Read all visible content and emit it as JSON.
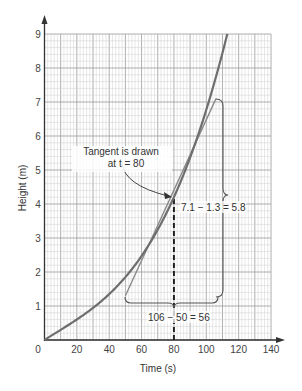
{
  "chart_data": {
    "type": "line",
    "title": "",
    "xlabel": "Time (s)",
    "ylabel": "Height (m)",
    "xlim": [
      0,
      140
    ],
    "ylim": [
      0,
      9
    ],
    "grid": true,
    "x_ticks": [
      "0",
      "20",
      "40",
      "60",
      "80",
      "100",
      "120",
      "140"
    ],
    "y_ticks": [
      "1",
      "2",
      "3",
      "4",
      "5",
      "6",
      "7",
      "8",
      "9"
    ],
    "series": [
      {
        "name": "height curve",
        "x": [
          0,
          20,
          40,
          60,
          80,
          100,
          113
        ],
        "values": [
          0,
          0.6,
          1.35,
          2.5,
          4.2,
          6.8,
          9.0
        ]
      },
      {
        "name": "tangent at t = 80",
        "x": [
          50,
          106
        ],
        "values": [
          1.3,
          7.1
        ]
      }
    ],
    "annotations": {
      "tangent_label_line1": "Tangent is drawn",
      "tangent_label_line2": "at t = 80",
      "rise_label": "7.1 − 1.3 = 5.8",
      "run_label": "106 − 50 = 56",
      "dashed_line_x": 80
    },
    "colors": {
      "curve": "#6e6e6e",
      "tangent": "#8a8a8a",
      "grid_minor": "#cfcfcf",
      "grid_major": "#9a9a9a",
      "axis": "#333333"
    }
  }
}
